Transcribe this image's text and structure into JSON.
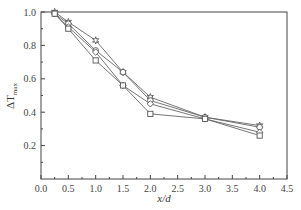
{
  "chart_data": {
    "type": "line",
    "title": "",
    "xlabel": "x/d",
    "ylabel": "ΔT_max",
    "ylabel_main": "ΔT",
    "ylabel_sub": "max",
    "xlim": [
      0.0,
      4.5
    ],
    "ylim": [
      0.0,
      1.0
    ],
    "xticks": [
      "0.0",
      "0.5",
      "1.0",
      "1.5",
      "2.0",
      "2.5",
      "3.0",
      "3.5",
      "4.0",
      "4.5"
    ],
    "yticks": [
      "0.2",
      "0.4",
      "0.6",
      "0.8",
      "1.0"
    ],
    "grid": false,
    "legend": "none",
    "x": [
      0.25,
      0.5,
      1.0,
      1.5,
      2.0,
      3.0,
      4.0
    ],
    "series": [
      {
        "name": "star",
        "marker": "star",
        "values": [
          1.0,
          0.94,
          0.83,
          0.64,
          0.49,
          0.37,
          0.32
        ]
      },
      {
        "name": "circle",
        "marker": "circle",
        "values": [
          0.99,
          0.93,
          0.77,
          0.64,
          0.47,
          0.37,
          0.31
        ]
      },
      {
        "name": "diamond",
        "marker": "diamond",
        "values": [
          0.99,
          0.91,
          0.76,
          0.56,
          0.45,
          0.36,
          0.28
        ]
      },
      {
        "name": "square",
        "marker": "square",
        "values": [
          0.99,
          0.9,
          0.71,
          0.56,
          0.39,
          0.36,
          0.26
        ]
      }
    ]
  }
}
